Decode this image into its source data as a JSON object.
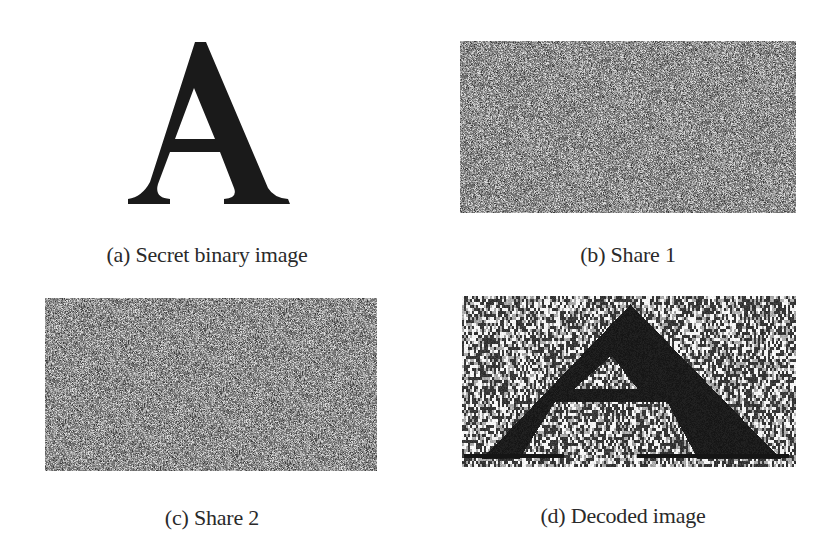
{
  "figure": {
    "panels": [
      {
        "id": "a",
        "caption": "(a) Secret binary image",
        "content": "letter-A",
        "letter": "A"
      },
      {
        "id": "b",
        "caption": "(b) Share 1",
        "content": "random-noise-share"
      },
      {
        "id": "c",
        "caption": "(c) Share 2",
        "content": "random-noise-share"
      },
      {
        "id": "d",
        "caption": "(d) Decoded image",
        "content": "decoded-letter-A-with-noise",
        "letter": "A"
      }
    ]
  },
  "colors": {
    "background": "#ffffff",
    "ink": "#1a1a1a",
    "caption": "#2a2a2a"
  }
}
